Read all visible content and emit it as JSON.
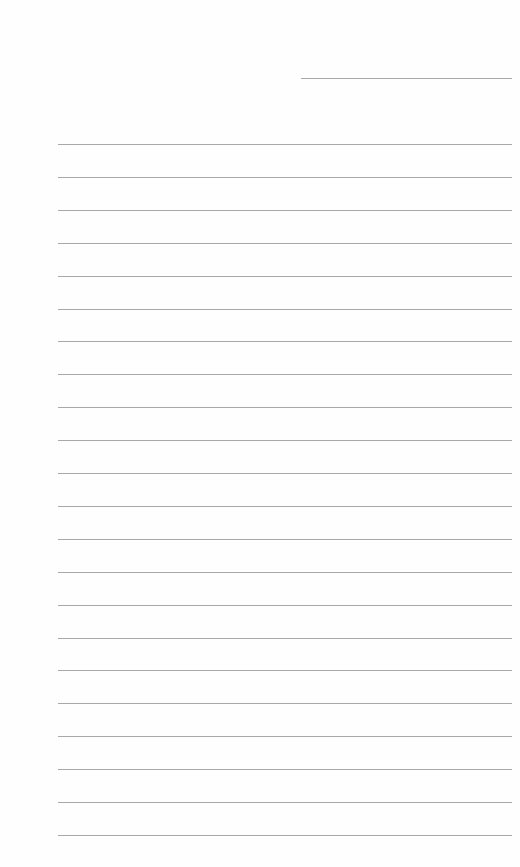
{
  "page": {
    "type": "lined-paper",
    "header_line": {
      "left": 301,
      "width": 211,
      "top": 78
    },
    "ruled_lines": {
      "count": 22,
      "left": 58,
      "right": 512,
      "first_top": 144,
      "spacing": 32.9
    },
    "line_color": "#a8a8a8",
    "background_color": "#fefefe"
  }
}
